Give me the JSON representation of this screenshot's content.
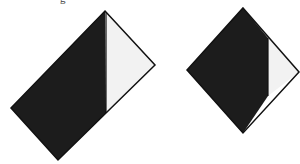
{
  "figure": {
    "caption_fragment": "g",
    "colors": {
      "dark": "#1c1c1c",
      "light": "#f2f2f2",
      "stroke": "#111111",
      "background": "#ffffff"
    },
    "shapes": [
      {
        "name": "tilted-rectangle",
        "outline": [
          [
            105,
            11
          ],
          [
            155,
            65
          ],
          [
            58,
            160
          ],
          [
            11,
            108
          ]
        ],
        "dark_region": [
          [
            105,
            11
          ],
          [
            106,
            113
          ],
          [
            58,
            160
          ],
          [
            11,
            108
          ]
        ],
        "light_region": [
          [
            106,
            12
          ],
          [
            155,
            65
          ],
          [
            106,
            113
          ]
        ],
        "divider": [
          [
            106,
            12
          ],
          [
            106,
            113
          ]
        ]
      },
      {
        "name": "diamond",
        "outline": [
          [
            243,
            8
          ],
          [
            299,
            72
          ],
          [
            243,
            133
          ],
          [
            187,
            70
          ]
        ],
        "dark_region": [
          [
            243,
            8
          ],
          [
            268,
            38
          ],
          [
            268,
            96
          ],
          [
            243,
            133
          ],
          [
            187,
            70
          ]
        ],
        "light_region": [
          [
            268,
            38
          ],
          [
            299,
            72
          ],
          [
            268,
            96
          ]
        ],
        "divider": [
          [
            268,
            38
          ],
          [
            268,
            96
          ]
        ]
      }
    ]
  }
}
